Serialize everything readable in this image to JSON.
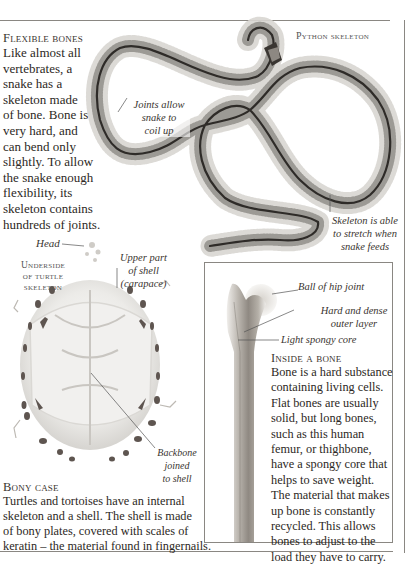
{
  "flexible_bones": {
    "heading": "Flexible bones",
    "lines": [
      "Like almost all",
      "vertebrates, a",
      "snake has a",
      "skeleton made",
      "of bone. Bone is",
      "very hard, and",
      "can bend only",
      "slightly. To allow",
      "the snake enough",
      "flexibility, its",
      "skeleton contains",
      "hundreds of joints."
    ]
  },
  "python": {
    "title": "Python skeleton",
    "label_joints": [
      "Joints allow",
      "snake to",
      "coil up"
    ],
    "label_stretch": [
      "Skeleton is able",
      "to stretch when",
      "snake feeds"
    ]
  },
  "turtle": {
    "title": [
      "Underside",
      "of turtle",
      "skeleton"
    ],
    "label_head": "Head",
    "label_upper": [
      "Upper part",
      "of shell",
      "(carapace)"
    ],
    "label_backbone": [
      "Backbone",
      "joined",
      "to shell"
    ]
  },
  "bony_case": {
    "heading": "Bony case",
    "lines": [
      "Turtles and tortoises have an internal",
      "skeleton and a shell. The shell is made",
      "of bony plates, covered with scales of",
      "keratin – the material found in fingernails."
    ]
  },
  "inside_bone": {
    "label_ball": "Ball of hip joint",
    "label_hard": [
      "Hard and dense",
      "outer layer"
    ],
    "label_spongy": "Light spongy core",
    "heading": "Inside a bone",
    "lines": [
      "Bone is a hard substance",
      "containing living cells.",
      "Flat bones are usually",
      "solid, but long bones,",
      "such as this human",
      "femur, or thighbone,",
      "have a spongy core that",
      "helps to save weight.",
      "The material that makes",
      "up bone is constantly",
      "recycled. This allows",
      "bones to adjust to the",
      "load they have to carry."
    ]
  },
  "colors": {
    "rule": "#8a8782",
    "text": "#2c2824",
    "bone": "#9a948c"
  }
}
